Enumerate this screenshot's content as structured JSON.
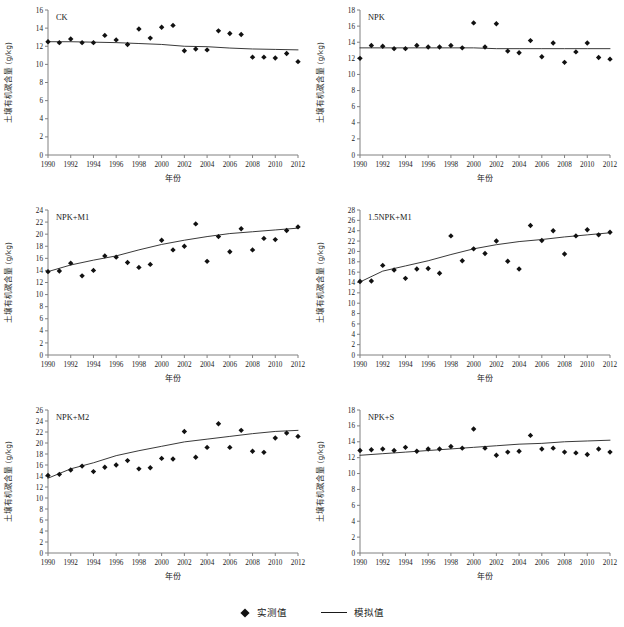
{
  "figure": {
    "xlabel": "年份",
    "ylabel": "土壤有机碳含量 (g/kg)",
    "legend": {
      "measured_label": "实测值",
      "simulated_label": "模拟值",
      "marker_icon": "diamond-marker-icon",
      "line_icon": "line-sample-icon"
    },
    "colors": {
      "axis": "#808080",
      "marker": "#111111",
      "line": "#222222",
      "text": "#1a1a1a",
      "background": "#ffffff"
    }
  },
  "chart_data": [
    {
      "type": "scatter",
      "title": "CK",
      "xlabel": "年份",
      "ylabel": "土壤有机碳含量 (g/kg)",
      "xlim": [
        1990,
        2012
      ],
      "ylim": [
        0,
        16
      ],
      "xticks": [
        1990,
        1992,
        1994,
        1996,
        1998,
        2000,
        2002,
        2004,
        2006,
        2008,
        2010,
        2012
      ],
      "yticks": [
        0,
        2,
        4,
        6,
        8,
        10,
        12,
        14,
        16
      ],
      "grid": false,
      "legend_position": "figure-bottom",
      "series": [
        {
          "name": "实测值",
          "marker": "diamond",
          "x": [
            1990,
            1991,
            1992,
            1993,
            1994,
            1995,
            1996,
            1997,
            1998,
            1999,
            2000,
            2001,
            2002,
            2003,
            2004,
            2005,
            2006,
            2007,
            2008,
            2009,
            2010,
            2011,
            2012
          ],
          "values": [
            12.5,
            12.4,
            12.8,
            12.4,
            12.4,
            13.2,
            12.7,
            12.2,
            13.9,
            12.9,
            14.1,
            14.3,
            11.5,
            11.7,
            11.6,
            13.7,
            13.4,
            13.3,
            10.8,
            10.8,
            10.7,
            11.2,
            10.3
          ]
        },
        {
          "name": "模拟值",
          "marker": "line",
          "x": [
            1990,
            1992,
            1994,
            1996,
            1998,
            2000,
            2002,
            2004,
            2006,
            2008,
            2010,
            2012
          ],
          "values": [
            12.5,
            12.5,
            12.45,
            12.4,
            12.3,
            12.2,
            12.0,
            11.95,
            11.8,
            11.7,
            11.65,
            11.6
          ]
        }
      ]
    },
    {
      "type": "scatter",
      "title": "NPK",
      "xlabel": "年份",
      "ylabel": "土壤有机碳含量 (g/kg)",
      "xlim": [
        1990,
        2012
      ],
      "ylim": [
        0,
        18
      ],
      "xticks": [
        1990,
        1992,
        1994,
        1996,
        1998,
        2000,
        2002,
        2004,
        2006,
        2008,
        2010,
        2012
      ],
      "yticks": [
        0,
        2,
        4,
        6,
        8,
        10,
        12,
        14,
        16,
        18
      ],
      "grid": false,
      "legend_position": "figure-bottom",
      "series": [
        {
          "name": "实测值",
          "marker": "diamond",
          "x": [
            1990,
            1991,
            1992,
            1993,
            1994,
            1995,
            1996,
            1997,
            1998,
            1999,
            2000,
            2001,
            2002,
            2003,
            2004,
            2005,
            2006,
            2007,
            2008,
            2009,
            2010,
            2011,
            2012
          ],
          "values": [
            12.0,
            13.6,
            13.5,
            13.2,
            13.2,
            13.6,
            13.4,
            13.4,
            13.6,
            13.3,
            16.4,
            13.4,
            16.3,
            12.9,
            12.7,
            14.2,
            12.2,
            13.9,
            11.5,
            12.8,
            13.9,
            12.1,
            11.9
          ]
        },
        {
          "name": "模拟值",
          "marker": "line",
          "x": [
            1990,
            1992,
            1994,
            1996,
            1998,
            2000,
            2002,
            2004,
            2006,
            2008,
            2010,
            2012
          ],
          "values": [
            13.3,
            13.3,
            13.3,
            13.3,
            13.3,
            13.3,
            13.2,
            13.2,
            13.2,
            13.2,
            13.2,
            13.2
          ]
        }
      ]
    },
    {
      "type": "scatter",
      "title": "NPK+M1",
      "xlabel": "年份",
      "ylabel": "土壤有机碳含量 (g/kg)",
      "xlim": [
        1990,
        2012
      ],
      "ylim": [
        0,
        24
      ],
      "xticks": [
        1990,
        1992,
        1994,
        1996,
        1998,
        2000,
        2002,
        2004,
        2006,
        2008,
        2010,
        2012
      ],
      "yticks": [
        0,
        2,
        4,
        6,
        8,
        10,
        12,
        14,
        16,
        18,
        20,
        22,
        24
      ],
      "grid": false,
      "legend_position": "figure-bottom",
      "series": [
        {
          "name": "实测值",
          "marker": "diamond",
          "x": [
            1990,
            1991,
            1992,
            1993,
            1994,
            1995,
            1996,
            1997,
            1998,
            1999,
            2000,
            2001,
            2002,
            2003,
            2004,
            2005,
            2006,
            2007,
            2008,
            2009,
            2010,
            2011,
            2012
          ],
          "values": [
            13.8,
            13.9,
            15.2,
            13.1,
            14.0,
            16.4,
            16.2,
            15.3,
            14.5,
            15.0,
            19.0,
            17.4,
            18.0,
            21.7,
            15.5,
            19.6,
            17.1,
            20.9,
            17.4,
            19.3,
            19.1,
            20.6,
            21.2
          ]
        },
        {
          "name": "模拟值",
          "marker": "line",
          "x": [
            1990,
            1992,
            1994,
            1996,
            1998,
            2000,
            2002,
            2004,
            2006,
            2008,
            2010,
            2012
          ],
          "values": [
            13.8,
            14.9,
            15.7,
            16.4,
            17.4,
            18.3,
            19.0,
            19.6,
            20.1,
            20.4,
            20.7,
            21.0
          ]
        }
      ]
    },
    {
      "type": "scatter",
      "title": "1.5NPK+M1",
      "xlabel": "年份",
      "ylabel": "土壤有机碳含量 (g/kg)",
      "xlim": [
        1990,
        2012
      ],
      "ylim": [
        0,
        28
      ],
      "xticks": [
        1990,
        1992,
        1994,
        1996,
        1998,
        2000,
        2002,
        2004,
        2006,
        2008,
        2010,
        2012
      ],
      "yticks": [
        0,
        2,
        4,
        6,
        8,
        10,
        12,
        14,
        16,
        18,
        20,
        22,
        24,
        26,
        28
      ],
      "grid": false,
      "legend_position": "figure-bottom",
      "series": [
        {
          "name": "实测值",
          "marker": "diamond",
          "x": [
            1990,
            1991,
            1992,
            1993,
            1994,
            1995,
            1996,
            1997,
            1998,
            1999,
            2000,
            2001,
            2002,
            2003,
            2004,
            2005,
            2006,
            2007,
            2008,
            2009,
            2010,
            2011,
            2012
          ],
          "values": [
            14.2,
            14.3,
            17.3,
            16.4,
            14.8,
            16.6,
            16.7,
            15.8,
            23.0,
            18.2,
            20.5,
            19.6,
            22.0,
            18.1,
            16.6,
            25.0,
            22.1,
            24.0,
            19.5,
            23.0,
            24.2,
            23.2,
            23.7
          ]
        },
        {
          "name": "模拟值",
          "marker": "line",
          "x": [
            1990,
            1992,
            1994,
            1996,
            1998,
            2000,
            2002,
            2004,
            2006,
            2008,
            2010,
            2012
          ],
          "values": [
            14.1,
            16.2,
            17.2,
            18.2,
            19.4,
            20.5,
            21.3,
            21.9,
            22.3,
            22.8,
            23.2,
            23.6
          ]
        }
      ]
    },
    {
      "type": "scatter",
      "title": "NPK+M2",
      "xlabel": "年份",
      "ylabel": "土壤有机碳含量 (g/kg)",
      "xlim": [
        1990,
        2012
      ],
      "ylim": [
        0,
        26
      ],
      "xticks": [
        1990,
        1992,
        1994,
        1996,
        1998,
        2000,
        2002,
        2004,
        2006,
        2008,
        2010,
        2012
      ],
      "yticks": [
        0,
        2,
        4,
        6,
        8,
        10,
        12,
        14,
        16,
        18,
        20,
        22,
        24,
        26
      ],
      "grid": false,
      "legend_position": "figure-bottom",
      "series": [
        {
          "name": "实测值",
          "marker": "diamond",
          "x": [
            1990,
            1991,
            1992,
            1993,
            1994,
            1995,
            1996,
            1997,
            1998,
            1999,
            2000,
            2001,
            2002,
            2003,
            2004,
            2005,
            2006,
            2007,
            2008,
            2009,
            2010,
            2011,
            2012
          ],
          "values": [
            14.1,
            14.3,
            15.1,
            15.8,
            14.8,
            15.6,
            16.0,
            16.8,
            15.3,
            15.5,
            17.2,
            17.1,
            22.1,
            17.4,
            19.2,
            23.5,
            19.2,
            22.3,
            18.5,
            18.3,
            20.9,
            21.8,
            21.2
          ]
        },
        {
          "name": "模拟值",
          "marker": "line",
          "x": [
            1990,
            1992,
            1994,
            1996,
            1998,
            2000,
            2002,
            2004,
            2006,
            2008,
            2010,
            2012
          ],
          "values": [
            13.6,
            15.3,
            16.4,
            17.7,
            18.6,
            19.4,
            20.2,
            20.7,
            21.2,
            21.7,
            22.1,
            22.3
          ]
        }
      ]
    },
    {
      "type": "scatter",
      "title": "NPK+S",
      "xlabel": "年份",
      "ylabel": "土壤有机碳含量 (g/kg)",
      "xlim": [
        1990,
        2012
      ],
      "ylim": [
        0,
        18
      ],
      "xticks": [
        1990,
        1992,
        1994,
        1996,
        1998,
        2000,
        2002,
        2004,
        2006,
        2008,
        2010,
        2012
      ],
      "yticks": [
        0,
        2,
        4,
        6,
        8,
        10,
        12,
        14,
        16,
        18
      ],
      "grid": false,
      "legend_position": "figure-bottom",
      "series": [
        {
          "name": "实测值",
          "marker": "diamond",
          "x": [
            1990,
            1991,
            1992,
            1993,
            1994,
            1995,
            1996,
            1997,
            1998,
            1999,
            2000,
            2001,
            2002,
            2003,
            2004,
            2005,
            2006,
            2007,
            2008,
            2009,
            2010,
            2011,
            2012
          ],
          "values": [
            12.9,
            13.0,
            13.1,
            12.9,
            13.3,
            12.8,
            13.1,
            13.1,
            13.4,
            13.2,
            15.6,
            13.2,
            12.3,
            12.7,
            12.8,
            14.8,
            13.1,
            13.2,
            12.7,
            12.6,
            12.4,
            13.1,
            12.7
          ]
        },
        {
          "name": "模拟值",
          "marker": "line",
          "x": [
            1990,
            1992,
            1994,
            1996,
            1998,
            2000,
            2002,
            2004,
            2006,
            2008,
            2010,
            2012
          ],
          "values": [
            12.3,
            12.5,
            12.7,
            12.9,
            13.1,
            13.3,
            13.5,
            13.7,
            13.8,
            14.0,
            14.1,
            14.2
          ]
        }
      ]
    }
  ]
}
